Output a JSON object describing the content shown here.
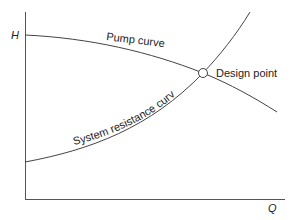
{
  "diagram": {
    "axes": {
      "y_label": "H",
      "x_label": "Q"
    },
    "curves": [
      {
        "name": "Pump curve",
        "label": "Pump curve"
      },
      {
        "name": "System resistance curve",
        "label": "System resistance curve"
      }
    ],
    "annotations": {
      "design_point": "Design point"
    },
    "colors": {
      "line": "#444444",
      "text": "#222222",
      "background": "#ffffff"
    }
  }
}
